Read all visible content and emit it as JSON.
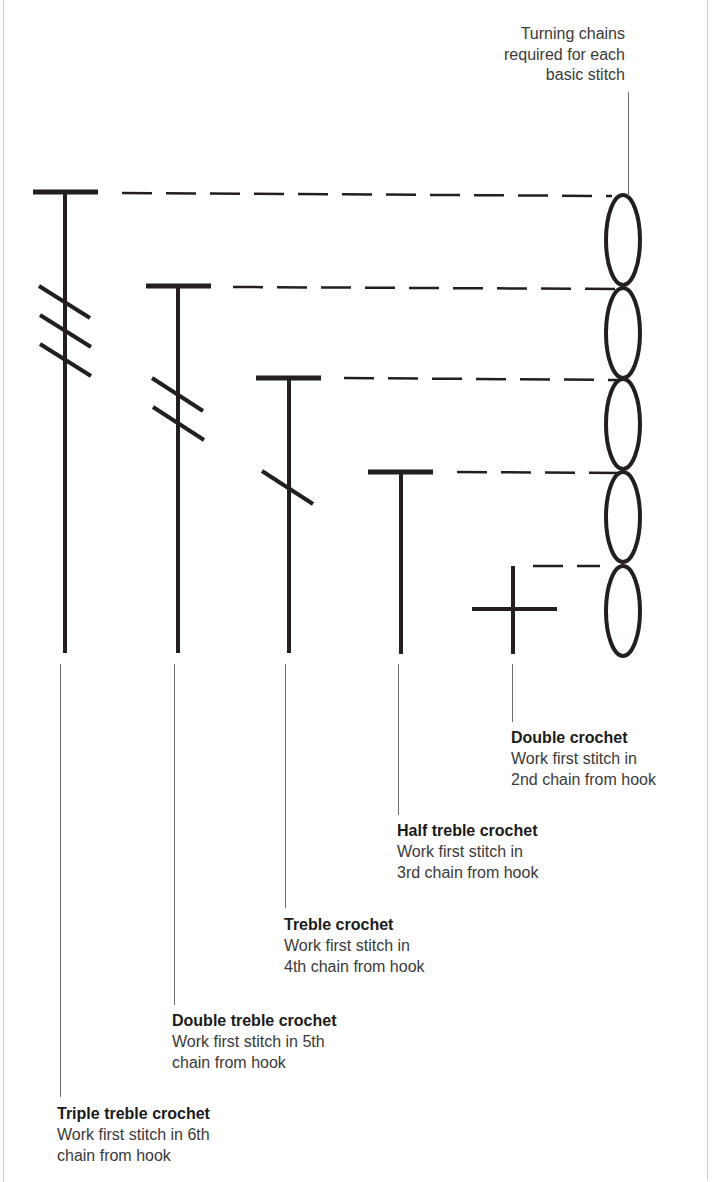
{
  "diagram": {
    "turning_chain_note": {
      "lines": [
        "Turning chains",
        "required for each",
        "basic stitch"
      ]
    },
    "colors": {
      "ink": "#231f20",
      "leader": "#6d6d6d",
      "frame": "#c8c8c8"
    },
    "stitches": [
      {
        "symbol": "triple-treble-crochet-symbol",
        "name": "Triple treble crochet",
        "lines": [
          "Work first stitch in 6th",
          "chain from hook"
        ],
        "turning_chains": 5,
        "slashes": 3
      },
      {
        "symbol": "double-treble-crochet-symbol",
        "name": "Double treble crochet",
        "lines": [
          "Work first stitch in 5th",
          "chain from hook"
        ],
        "turning_chains": 4,
        "slashes": 2
      },
      {
        "symbol": "treble-crochet-symbol",
        "name": "Treble crochet",
        "lines": [
          "Work first stitch in",
          "4th chain from hook"
        ],
        "turning_chains": 3,
        "slashes": 1
      },
      {
        "symbol": "half-treble-crochet-symbol",
        "name": "Half treble crochet",
        "lines": [
          "Work first stitch in",
          "3rd chain from hook"
        ],
        "turning_chains": 2,
        "slashes": 0
      },
      {
        "symbol": "double-crochet-symbol",
        "name": "Double crochet",
        "lines": [
          "Work first stitch in",
          "2nd chain from hook"
        ],
        "turning_chains": 1,
        "slashes": 0
      }
    ],
    "chain_count": 5
  }
}
